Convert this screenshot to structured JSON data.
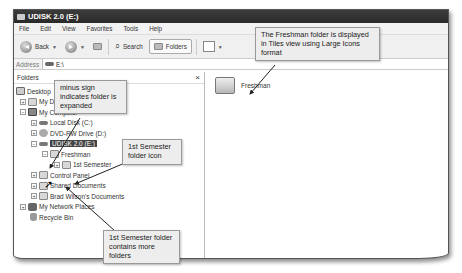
{
  "window": {
    "title": "UDISK 2.0 (E:)",
    "menu": [
      "File",
      "Edit",
      "View",
      "Favorites",
      "Tools",
      "Help"
    ],
    "toolbar": {
      "back_label": "Back",
      "search_label": "Search",
      "folders_label": "Folders"
    },
    "address": {
      "label": "Address",
      "value": "E:\\"
    }
  },
  "folders_pane": {
    "title": "Folders",
    "close_symbol": "×",
    "tree": [
      {
        "label": "Desktop",
        "level": 0,
        "toggle": "",
        "icon": "desktop-icon"
      },
      {
        "label": "My Documents",
        "level": 1,
        "toggle": "+",
        "icon": "my-documents-icon"
      },
      {
        "label": "My Computer",
        "level": 1,
        "toggle": "−",
        "icon": "computer-icon"
      },
      {
        "label": "Local Disk (C:)",
        "level": 2,
        "toggle": "+",
        "icon": "disk-icon"
      },
      {
        "label": "DVD-RW Drive (D:)",
        "level": 2,
        "toggle": "+",
        "icon": "dvd-icon"
      },
      {
        "label": "UDISK 2.0 (E:)",
        "level": 2,
        "toggle": "−",
        "icon": "usb-drive-icon",
        "selected": true
      },
      {
        "label": "Freshman",
        "level": 3,
        "toggle": "−",
        "icon": "folder-icon"
      },
      {
        "label": "1st Semester",
        "level": 4,
        "toggle": "+",
        "icon": "folder-icon"
      },
      {
        "label": "Control Panel",
        "level": 2,
        "toggle": "+",
        "icon": "control-panel-icon"
      },
      {
        "label": "Shared Documents",
        "level": 2,
        "toggle": "+",
        "icon": "folder-icon"
      },
      {
        "label": "Brad Wilson's Documents",
        "level": 2,
        "toggle": "+",
        "icon": "folder-icon"
      },
      {
        "label": "My Network Places",
        "level": 1,
        "toggle": "+",
        "icon": "network-icon"
      },
      {
        "label": "Recycle Bin",
        "level": 1,
        "toggle": "",
        "icon": "recycle-bin-icon"
      }
    ]
  },
  "content_pane": {
    "items": [
      {
        "label": "Freshman",
        "icon": "large-folder-icon"
      }
    ]
  },
  "callouts": {
    "tiles_view": "The Freshman folder is displayed in Tiles view using Large Icons format",
    "minus_sign": "minus sign indicates folder is expanded",
    "semester_icon": "1st Semester folder icon",
    "semester_contains": "1st Semester folder contains more folders"
  }
}
